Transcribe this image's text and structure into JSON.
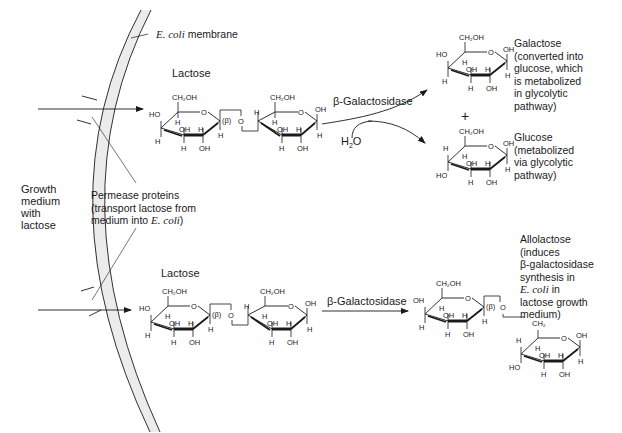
{
  "figure": {
    "membrane_label_italic": "E. coli",
    "membrane_label_rest": " membrane",
    "medium_label": [
      "Growth",
      "medium",
      "with",
      "lactose"
    ],
    "permease_label": {
      "line1": "Permease proteins",
      "line2": "(transport lactose from",
      "line3_prefix": "medium into ",
      "line3_italic": "E. coli",
      "line3_suffix": ")"
    },
    "top_reaction": {
      "substrate": "Lactose",
      "enzyme": "β-Galactosidase",
      "cosubstrate": "H2O",
      "plus": "+",
      "products": [
        {
          "name": "Galactose",
          "note": [
            "(converted into",
            "glucose, which",
            "is metabolized",
            "in glycolytic",
            "pathway)"
          ]
        },
        {
          "name": "Glucose",
          "note": [
            "(metabolized",
            "via glycolytic",
            "pathway)"
          ]
        }
      ]
    },
    "bottom_reaction": {
      "substrate": "Lactose",
      "enzyme": "β-Galactosidase",
      "product": {
        "name": "Allolactose",
        "note_1": "(induces",
        "note_2": "β-galactosidase",
        "note_3": "synthesis in",
        "note_4_italic": "E. coli",
        "note_4_rest": " in",
        "note_5": "lactose growth",
        "note_6": "medium)"
      }
    },
    "atoms": {
      "ch2oh": "CH₂OH",
      "ch2": "CH₂",
      "oh": "OH",
      "ho": "HO",
      "h": "H",
      "o": "O",
      "beta": "(β)"
    },
    "colors": {
      "membrane_fill": "#ececec",
      "line": "#1a1a1a"
    }
  }
}
